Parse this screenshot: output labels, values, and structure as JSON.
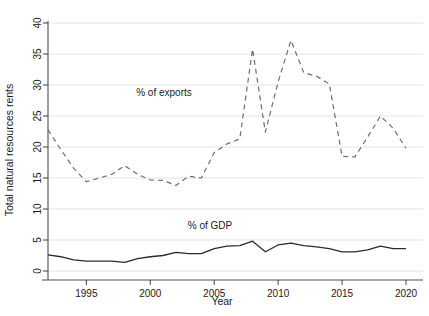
{
  "chart_data": {
    "type": "line",
    "title": "",
    "xlabel": "Year",
    "ylabel": "Total natural resources rents",
    "xlim": [
      1992,
      2020
    ],
    "ylim": [
      0,
      40
    ],
    "xticks": [
      1995,
      2000,
      2005,
      2010,
      2015,
      2020
    ],
    "yticks": [
      0,
      5,
      10,
      15,
      20,
      25,
      30,
      35,
      40
    ],
    "grid": "horizontal",
    "legend_position": "inline-annotations",
    "x": [
      1992,
      1993,
      1994,
      1995,
      1996,
      1997,
      1998,
      1999,
      2000,
      2001,
      2002,
      2003,
      2004,
      2005,
      2006,
      2007,
      2008,
      2009,
      2010,
      2011,
      2012,
      2013,
      2014,
      2015,
      2016,
      2017,
      2018,
      2019,
      2020
    ],
    "series": [
      {
        "name": "% of exports",
        "style": "dashed",
        "color": "#6e6e6e",
        "annotation": "% of exports",
        "values": [
          22.8,
          19.6,
          16.8,
          14.4,
          15.0,
          15.6,
          17.0,
          15.8,
          15.0,
          14.8,
          13.8,
          15.2,
          15.0,
          19.0,
          20.4,
          21.2,
          19.0,
          19.6,
          19.8,
          18.2,
          19.8,
          18.9,
          15.5,
          19.0,
          24.0,
          29.0,
          35.8,
          22.4,
          29.0
        ]
      },
      {
        "name": "% of GDP",
        "style": "solid",
        "color": "#2b2b2b",
        "annotation": "% of GDP",
        "values": [
          2.7,
          2.3,
          1.8,
          1.6,
          1.6,
          1.6,
          1.4,
          2.0,
          2.3,
          2.6,
          3.0,
          2.9,
          2.8,
          3.6,
          3.9,
          4.1,
          4.7,
          3.1,
          3.9,
          4.4,
          4.1,
          3.9,
          3.6,
          3.1,
          3.1,
          3.4,
          3.9,
          3.6,
          3.6
        ]
      }
    ],
    "series_exports_full": {
      "comment": "ordered yearly values used for the dashed upper line",
      "points": [
        {
          "year": 1992,
          "value": 22.8
        },
        {
          "year": 1993,
          "value": 19.6
        },
        {
          "year": 1994,
          "value": 16.6
        },
        {
          "year": 1995,
          "value": 14.4
        },
        {
          "year": 1996,
          "value": 15.0
        },
        {
          "year": 1997,
          "value": 15.6
        },
        {
          "year": 1998,
          "value": 17.0
        },
        {
          "year": 1999,
          "value": 15.6
        },
        {
          "year": 2000,
          "value": 14.7
        },
        {
          "year": 2001,
          "value": 14.6
        },
        {
          "year": 2002,
          "value": 13.8
        },
        {
          "year": 2003,
          "value": 15.3
        },
        {
          "year": 2004,
          "value": 15.0
        },
        {
          "year": 2005,
          "value": 19.1
        },
        {
          "year": 2006,
          "value": 20.5
        },
        {
          "year": 2007,
          "value": 21.3
        },
        {
          "year": 2008,
          "value": 35.8
        },
        {
          "year": 2009,
          "value": 22.4
        },
        {
          "year": 2010,
          "value": 30.5
        },
        {
          "year": 2011,
          "value": 37.2
        },
        {
          "year": 2012,
          "value": 32.0
        },
        {
          "year": 2013,
          "value": 31.4
        },
        {
          "year": 2014,
          "value": 30.2
        },
        {
          "year": 2015,
          "value": 18.5
        },
        {
          "year": 2016,
          "value": 18.4
        },
        {
          "year": 2017,
          "value": 21.6
        },
        {
          "year": 2018,
          "value": 25.0
        },
        {
          "year": 2019,
          "value": 23.0
        },
        {
          "year": 2020,
          "value": 19.8
        }
      ]
    },
    "series_gdp_full": {
      "comment": "ordered yearly values used for the solid lower line",
      "points": [
        {
          "year": 1992,
          "value": 2.6
        },
        {
          "year": 1993,
          "value": 2.3
        },
        {
          "year": 1994,
          "value": 1.8
        },
        {
          "year": 1995,
          "value": 1.6
        },
        {
          "year": 1996,
          "value": 1.6
        },
        {
          "year": 1997,
          "value": 1.6
        },
        {
          "year": 1998,
          "value": 1.4
        },
        {
          "year": 1999,
          "value": 2.0
        },
        {
          "year": 2000,
          "value": 2.3
        },
        {
          "year": 2001,
          "value": 2.5
        },
        {
          "year": 2002,
          "value": 3.0
        },
        {
          "year": 2003,
          "value": 2.8
        },
        {
          "year": 2004,
          "value": 2.8
        },
        {
          "year": 2005,
          "value": 3.6
        },
        {
          "year": 2006,
          "value": 4.0
        },
        {
          "year": 2007,
          "value": 4.1
        },
        {
          "year": 2008,
          "value": 4.8
        },
        {
          "year": 2009,
          "value": 3.1
        },
        {
          "year": 2010,
          "value": 4.2
        },
        {
          "year": 2011,
          "value": 4.5
        },
        {
          "year": 2012,
          "value": 4.1
        },
        {
          "year": 2013,
          "value": 3.9
        },
        {
          "year": 2014,
          "value": 3.6
        },
        {
          "year": 2015,
          "value": 3.1
        },
        {
          "year": 2016,
          "value": 3.1
        },
        {
          "year": 2017,
          "value": 3.4
        },
        {
          "year": 2018,
          "value": 4.0
        },
        {
          "year": 2019,
          "value": 3.6
        },
        {
          "year": 2020,
          "value": 3.6
        }
      ]
    },
    "colors": {
      "background": "#ffffff",
      "gridline": "#e3e3e3",
      "axis": "#4d4d4d",
      "text": "#1a1a1a",
      "exports_line": "#6e6e6e",
      "gdp_line": "#2b2b2b"
    }
  }
}
